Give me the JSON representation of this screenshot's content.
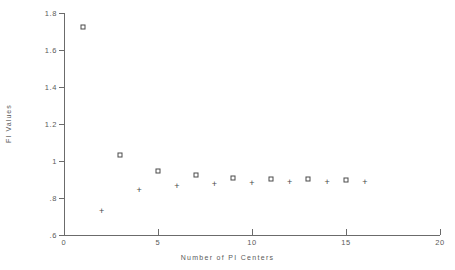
{
  "faint_header": "",
  "chart_data": {
    "type": "scatter",
    "title": "",
    "xlabel": "Number of PI Centers",
    "ylabel": "FI Values",
    "xlim": [
      0,
      20
    ],
    "ylim": [
      0.6,
      1.8
    ],
    "xticks": [
      0,
      5,
      10,
      15,
      20
    ],
    "xtick_labels": [
      "0",
      "5",
      "10",
      "15",
      "20"
    ],
    "yticks": [
      0.6,
      0.8,
      1.0,
      1.2,
      1.4,
      1.6,
      1.8
    ],
    "ytick_labels": [
      ".6",
      ".8",
      "1",
      "1.2",
      "1.4",
      "1.6",
      "1.8"
    ],
    "grid": false,
    "legend": null,
    "series": [
      {
        "name": "square-series",
        "marker": "square",
        "color": "#4a4a4a",
        "points": [
          {
            "x": 1,
            "y": 1.725
          },
          {
            "x": 3,
            "y": 1.03
          },
          {
            "x": 5,
            "y": 0.945
          },
          {
            "x": 7,
            "y": 0.922
          },
          {
            "x": 9,
            "y": 0.91
          },
          {
            "x": 11,
            "y": 0.905
          },
          {
            "x": 13,
            "y": 0.903
          },
          {
            "x": 15,
            "y": 0.9
          }
        ]
      },
      {
        "name": "plus-series",
        "marker": "plus",
        "color": "#4a4a4a",
        "points": [
          {
            "x": 2,
            "y": 0.732
          },
          {
            "x": 4,
            "y": 0.842
          },
          {
            "x": 6,
            "y": 0.866
          },
          {
            "x": 8,
            "y": 0.875
          },
          {
            "x": 10,
            "y": 0.88
          },
          {
            "x": 12,
            "y": 0.884
          },
          {
            "x": 14,
            "y": 0.886
          },
          {
            "x": 16,
            "y": 0.889
          }
        ]
      }
    ]
  }
}
